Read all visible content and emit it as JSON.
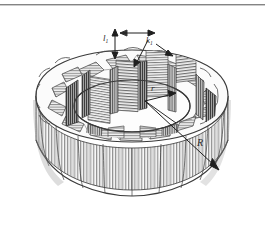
{
  "figure": {
    "style": "engraved line drawing, grayscale cross-hatching",
    "background_color": "#ffffff",
    "ink_color": "#2b2b2b",
    "hatch_color": "#6b6b6b",
    "shade_color": "#b9b9b9",
    "lobe_count": 12,
    "visible_slot_count": 12
  },
  "rule": {
    "name": "page-top-rule",
    "color": "#6f6f6f"
  },
  "labels": {
    "slot_width": {
      "text": "l",
      "sub": "1"
    },
    "tooth_width": {
      "text": "k",
      "sub": "1"
    },
    "inner_radius": {
      "text": "r",
      "sub": ""
    },
    "outer_radius": {
      "text": "R",
      "sub": ""
    }
  },
  "annotations": {
    "inner_radius_leader": "arrow from ring centre to inner bore wall",
    "outer_radius_leader": "arrow from ring centre to outer rim",
    "slot_width_leader": "vertical double arrow across slot opening",
    "tooth_width_leader": "diagonal leader from label to tooth face"
  }
}
